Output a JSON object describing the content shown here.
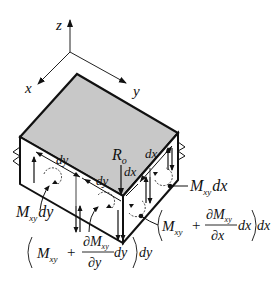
{
  "diagram": {
    "axes": {
      "x_label": "x",
      "y_label": "y",
      "z_label": "z"
    },
    "dimensions": {
      "dy_left": "dy",
      "dy_mid": "dy",
      "dx_right": "dx",
      "dx_mid": "dx"
    },
    "corner_force": {
      "R": "R",
      "sub": "o"
    },
    "moments": {
      "left_face": {
        "M": "M",
        "sub": "xy",
        "suffix": "dy"
      },
      "right_face": {
        "M": "M",
        "sub": "xy",
        "suffix": "dx"
      },
      "front_left": {
        "M": "M",
        "sub": "xy",
        "plus": "+",
        "num": "∂M",
        "num_sub": "xy",
        "den": "∂y",
        "inner": "dy",
        "outer": "dy"
      },
      "front_right": {
        "M": "M",
        "sub": "xy",
        "plus": "+",
        "num": "∂M",
        "num_sub": "xy",
        "den": "∂x",
        "inner": "dx",
        "outer": "dx"
      }
    },
    "colors": {
      "top_face": "#c8c8c8",
      "side_face": "#ffffff",
      "lines": "#111111"
    }
  }
}
